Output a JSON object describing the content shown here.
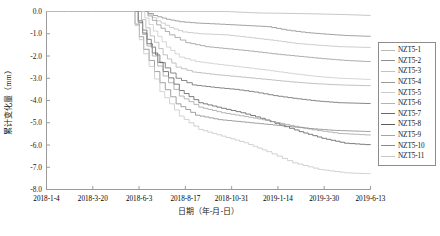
{
  "chart_data": {
    "type": "line",
    "title": "",
    "xlabel": "日期（年-月-日）",
    "ylabel": "累计变化量（mm）",
    "ylim": [
      -8.0,
      0.0
    ],
    "yticks": [
      "0.0",
      "-1.0",
      "-2.0",
      "-3.0",
      "-4.0",
      "-5.0",
      "-6.0",
      "-7.0",
      "-8.0"
    ],
    "ytick_values": [
      0.0,
      -1.0,
      -2.0,
      -3.0,
      -4.0,
      -5.0,
      -6.0,
      -7.0,
      -8.0
    ],
    "xticks": [
      "2018-1-4",
      "2018-3-20",
      "2018-6-3",
      "2018-8-17",
      "2018-10-31",
      "2019-1-14",
      "2019-3-30",
      "2019-6-13"
    ],
    "xtick_index": [
      0,
      1,
      2,
      3,
      4,
      5,
      6,
      7
    ],
    "grid": false,
    "legend_position": "right",
    "legend_entries": [
      "NZT5-1",
      "NZT5-2",
      "NZT5-3",
      "NZT5-4",
      "NZT5-5",
      "NZT5-6",
      "NZT5-7",
      "NZT5-8",
      "NZT5-9",
      "NZT5-10",
      "NZT5-11"
    ],
    "series": [
      {
        "name": "NZT5-1",
        "color": "#b9b9b9",
        "x": [
          0.0,
          0.55,
          0.62,
          0.66,
          0.72,
          0.8,
          0.86,
          0.92,
          0.96,
          1.0
        ],
        "values": [
          0.0,
          0.0,
          -0.05,
          -0.07,
          -0.08,
          -0.1,
          -0.12,
          -0.14,
          -0.16,
          -0.18
        ]
      },
      {
        "name": "NZT5-2",
        "color": "#8d8d8d",
        "x": [
          0.0,
          0.3,
          0.33,
          0.37,
          0.41,
          0.46,
          0.52,
          0.6,
          0.68,
          0.74,
          0.8,
          0.86,
          0.92,
          1.0
        ],
        "values": [
          0.0,
          0.0,
          -0.18,
          -0.35,
          -0.46,
          -0.52,
          -0.56,
          -0.62,
          -0.68,
          -0.84,
          -0.95,
          -1.02,
          -1.08,
          -1.12
        ]
      },
      {
        "name": "NZT5-3",
        "color": "#c2c2c2",
        "x": [
          0.0,
          0.3,
          0.34,
          0.38,
          0.42,
          0.47,
          0.55,
          0.63,
          0.7,
          0.77,
          0.84,
          0.9,
          1.0
        ],
        "values": [
          0.0,
          0.0,
          -0.42,
          -0.72,
          -0.92,
          -1.0,
          -1.05,
          -1.18,
          -1.3,
          -1.44,
          -1.52,
          -1.58,
          -1.62
        ]
      },
      {
        "name": "NZT5-4",
        "color": "#9a9a9a",
        "x": [
          0.0,
          0.3,
          0.34,
          0.38,
          0.43,
          0.49,
          0.56,
          0.64,
          0.71,
          0.78,
          0.85,
          0.92,
          1.0
        ],
        "values": [
          0.0,
          0.0,
          -0.6,
          -1.05,
          -1.4,
          -1.58,
          -1.68,
          -1.8,
          -1.92,
          -2.02,
          -2.12,
          -2.2,
          -2.26
        ]
      },
      {
        "name": "NZT5-5",
        "color": "#cccccc",
        "x": [
          0.0,
          0.29,
          0.33,
          0.37,
          0.41,
          0.46,
          0.53,
          0.61,
          0.69,
          0.76,
          0.83,
          0.9,
          1.0
        ],
        "values": [
          0.0,
          0.0,
          -0.88,
          -1.6,
          -2.05,
          -2.25,
          -2.38,
          -2.52,
          -2.66,
          -2.8,
          -2.92,
          -3.0,
          -3.06
        ]
      },
      {
        "name": "NZT5-6",
        "color": "#b3b3b3",
        "x": [
          0.0,
          0.28,
          0.32,
          0.36,
          0.4,
          0.45,
          0.52,
          0.6,
          0.68,
          0.75,
          0.82,
          0.9,
          1.0
        ],
        "values": [
          0.0,
          0.0,
          -1.1,
          -1.95,
          -2.5,
          -2.72,
          -2.84,
          -2.95,
          -3.06,
          -3.16,
          -3.24,
          -3.3,
          -3.34
        ]
      },
      {
        "name": "NZT5-7",
        "color": "#6a6a6a",
        "x": [
          0.0,
          0.27,
          0.31,
          0.35,
          0.4,
          0.45,
          0.52,
          0.58,
          0.64,
          0.7,
          0.76,
          0.83,
          0.9,
          1.0
        ],
        "values": [
          0.0,
          0.0,
          -1.25,
          -2.3,
          -3.0,
          -3.3,
          -3.42,
          -3.5,
          -3.62,
          -3.78,
          -3.9,
          -4.02,
          -4.1,
          -4.14
        ]
      },
      {
        "name": "NZT5-8",
        "color": "#5c5c5c",
        "x": [
          0.0,
          0.27,
          0.31,
          0.36,
          0.41,
          0.47,
          0.54,
          0.6,
          0.66,
          0.72,
          0.78,
          0.85,
          0.92,
          1.0
        ],
        "values": [
          0.0,
          0.0,
          -1.45,
          -2.7,
          -3.55,
          -4.1,
          -4.35,
          -4.55,
          -4.8,
          -5.1,
          -5.4,
          -5.7,
          -5.92,
          -6.0
        ]
      },
      {
        "name": "NZT5-9",
        "color": "#a3a3a3",
        "x": [
          0.0,
          0.27,
          0.31,
          0.36,
          0.41,
          0.47,
          0.54,
          0.61,
          0.68,
          0.75,
          0.82,
          0.9,
          1.0
        ],
        "values": [
          0.0,
          0.0,
          -1.55,
          -2.9,
          -3.8,
          -4.3,
          -4.55,
          -4.72,
          -4.9,
          -5.12,
          -5.32,
          -5.48,
          -5.56
        ]
      },
      {
        "name": "NZT5-10",
        "color": "#8a8a8a",
        "x": [
          0.0,
          0.26,
          0.3,
          0.35,
          0.4,
          0.46,
          0.53,
          0.6,
          0.67,
          0.74,
          0.81,
          0.88,
          1.0
        ],
        "values": [
          0.0,
          0.0,
          -1.7,
          -3.2,
          -4.15,
          -4.66,
          -4.86,
          -4.96,
          -5.06,
          -5.16,
          -5.26,
          -5.34,
          -5.4
        ]
      },
      {
        "name": "NZT5-11",
        "color": "#c7c7c7",
        "x": [
          0.0,
          0.26,
          0.3,
          0.35,
          0.41,
          0.47,
          0.54,
          0.61,
          0.68,
          0.76,
          0.84,
          0.92,
          1.0
        ],
        "values": [
          0.0,
          0.0,
          -1.9,
          -3.6,
          -4.7,
          -5.3,
          -5.6,
          -5.9,
          -6.3,
          -6.8,
          -7.1,
          -7.25,
          -7.3
        ]
      }
    ]
  }
}
